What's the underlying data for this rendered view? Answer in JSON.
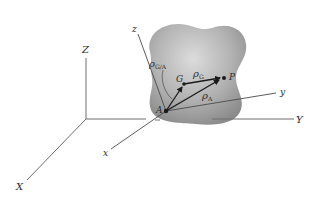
{
  "diagram": {
    "colors": {
      "axis": "#6e6e6e",
      "vector": "#1a1a1a",
      "body_fill_light": "#d4d4d4",
      "body_fill_dark": "#8f8f8f",
      "background": "#ffffff"
    },
    "global_axes": {
      "Z_label": "Z",
      "Y_label": "Y",
      "X_label": "X"
    },
    "local_axes": {
      "z_label": "z",
      "y_label": "y",
      "x_label": "x"
    },
    "points": {
      "A": "A",
      "G": "G",
      "P": "P"
    },
    "vectors": {
      "rho_GA": {
        "symbol": "ρ",
        "subscript": "G/A"
      },
      "rho_G": {
        "symbol": "ρ",
        "subscript": "G"
      },
      "rho_A": {
        "symbol": "ρ",
        "subscript": "A"
      }
    }
  }
}
